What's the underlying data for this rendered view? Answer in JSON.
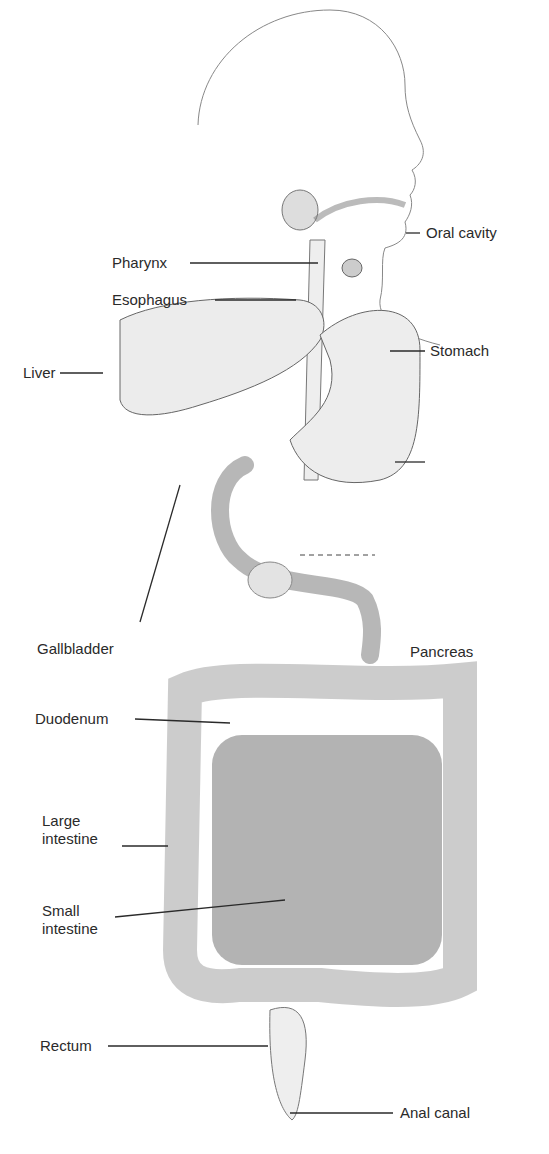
{
  "diagram": {
    "type": "anatomical-labeled-illustration",
    "labels": [
      {
        "id": "oral-cavity",
        "text": "Oral cavity",
        "side": "right"
      },
      {
        "id": "pharynx",
        "text": "Pharynx",
        "side": "left"
      },
      {
        "id": "esophagus",
        "text": "Esophagus",
        "side": "left"
      },
      {
        "id": "liver",
        "text": "Liver",
        "side": "left"
      },
      {
        "id": "stomach",
        "text": "Stomach",
        "side": "right"
      },
      {
        "id": "gallbladder",
        "text": "Gallbladder",
        "side": "left"
      },
      {
        "id": "pancreas",
        "text": "Pancreas",
        "side": "right"
      },
      {
        "id": "duodenum",
        "text": "Duodenum",
        "side": "left"
      },
      {
        "id": "large-intestine",
        "text": "Large intestine",
        "side": "left"
      },
      {
        "id": "small-intestine",
        "text": "Small intestine",
        "side": "left"
      },
      {
        "id": "rectum",
        "text": "Rectum",
        "side": "left"
      },
      {
        "id": "anal-canal",
        "text": "Anal canal",
        "side": "right"
      }
    ],
    "colors": {
      "background": "#ffffff",
      "line": "#2a2a2a",
      "organ_fill": "#ececec",
      "intestine_fill": "#8a8a8a"
    }
  }
}
